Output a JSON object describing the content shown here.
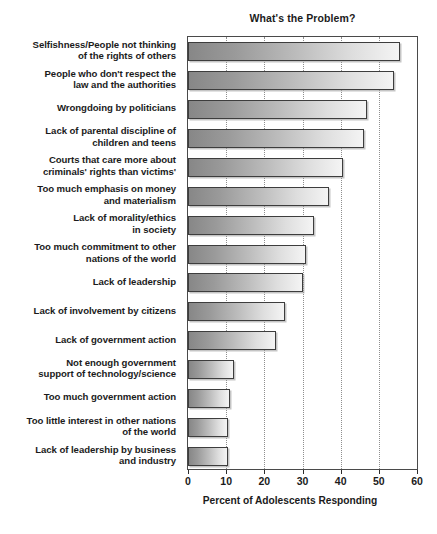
{
  "chart_data": {
    "type": "bar",
    "orientation": "horizontal",
    "title": "What's the Problem?",
    "xlabel": "Percent of Adolescents Responding",
    "ylabel": "",
    "xlim": [
      0,
      60
    ],
    "xticks": [
      0,
      10,
      20,
      30,
      40,
      50,
      60
    ],
    "xtick_labels": [
      "0",
      "10",
      "20",
      "30",
      "40",
      "50",
      "60"
    ],
    "grid": true,
    "grid_axis": "x",
    "grid_style": "dotted",
    "legend": false,
    "categories": [
      "Selfishness/People not thinking of the rights of others",
      "People who don't respect the law and the authorities",
      "Wrongdoing by politicians",
      "Lack of parental discipline of children and teens",
      "Courts that care more about criminals' rights than victims'",
      "Too much emphasis on money and materialism",
      "Lack of morality/ethics in society",
      "Too much commitment to other nations of the world",
      "Lack of leadership",
      "Lack of involvement by citizens",
      "Lack of government action",
      "Not enough government support of technology/science",
      "Too much government action",
      "Too little interest in other nations of the world",
      "Lack of leadership by business and industry"
    ],
    "category_lines": [
      [
        "Selfishness/People not thinking",
        "of the rights of others"
      ],
      [
        "People who don't respect the",
        "law and the authorities"
      ],
      [
        "Wrongdoing by politicians"
      ],
      [
        "Lack of parental discipline of",
        "children and teens"
      ],
      [
        "Courts that care more about",
        "criminals' rights than victims'"
      ],
      [
        "Too much emphasis on money",
        "and materialism"
      ],
      [
        "Lack of morality/ethics",
        "in society"
      ],
      [
        "Too much commitment to other",
        "nations of the world"
      ],
      [
        "Lack of leadership"
      ],
      [
        "Lack of involvement by citizens"
      ],
      [
        "Lack of government action"
      ],
      [
        "Not enough government",
        "support of technology/science"
      ],
      [
        "Too much government action"
      ],
      [
        "Too little interest in other nations",
        "of the world"
      ],
      [
        "Lack of leadership by business",
        "and industry"
      ]
    ],
    "values": [
      55.5,
      54,
      47,
      46,
      40.5,
      37,
      33,
      31,
      30,
      25.5,
      23,
      12,
      11,
      10.5,
      10.5
    ],
    "bar_colors": {
      "gradient_start": "#878787",
      "gradient_end": "#f4f4f4",
      "border": "#3d3d3d"
    }
  },
  "axis": {
    "tick_labels": [
      "0",
      "10",
      "20",
      "30",
      "40",
      "50",
      "60"
    ],
    "title": "Percent of Adolescents Responding"
  },
  "header": {
    "title": "What's the Problem?"
  }
}
